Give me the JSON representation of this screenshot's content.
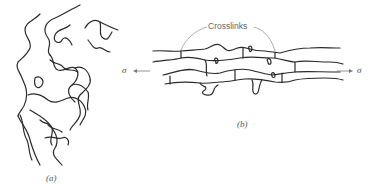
{
  "figure": {
    "panel_a": {
      "label": "(a)",
      "description": "unstretched entangled polymer chains"
    },
    "panel_b": {
      "label": "(b)",
      "description": "stretched crosslinked polymer chains"
    },
    "annotation": "Crosslinks",
    "stress_left": "σ",
    "stress_right": "σ"
  },
  "colors": {
    "line": "#2a2a2a",
    "annotation_line": "#999999",
    "background": "#ffffff"
  }
}
